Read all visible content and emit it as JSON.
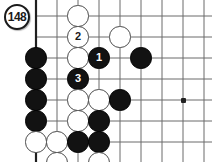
{
  "diagram": {
    "badge_label": "148",
    "board": {
      "origin_x": 36,
      "origin_y": 16,
      "spacing": 21,
      "left_edge_thick": true,
      "bottom_edge_thick": true,
      "columns": 9,
      "rows": 7,
      "line_color": "#6a6a6a",
      "edge_color": "#1f1f1f",
      "background": "#ffffff"
    },
    "star_points": [
      {
        "col": 7,
        "row": 4
      }
    ],
    "stones": [
      {
        "color": "white",
        "col": 2,
        "row": 0,
        "label": ""
      },
      {
        "color": "white",
        "col": 2,
        "row": 1,
        "label": "2"
      },
      {
        "color": "white",
        "col": 4,
        "row": 1,
        "label": ""
      },
      {
        "color": "black",
        "col": 0,
        "row": 2,
        "label": ""
      },
      {
        "color": "white",
        "col": 2,
        "row": 2,
        "label": ""
      },
      {
        "color": "black",
        "col": 3,
        "row": 2,
        "label": "1"
      },
      {
        "color": "black",
        "col": 5,
        "row": 2,
        "label": ""
      },
      {
        "color": "black",
        "col": 0,
        "row": 3,
        "label": ""
      },
      {
        "color": "black",
        "col": 2,
        "row": 3,
        "label": "3"
      },
      {
        "color": "black",
        "col": 0,
        "row": 4,
        "label": ""
      },
      {
        "color": "white",
        "col": 2,
        "row": 4,
        "label": ""
      },
      {
        "color": "white",
        "col": 3,
        "row": 4,
        "label": ""
      },
      {
        "color": "black",
        "col": 4,
        "row": 4,
        "label": ""
      },
      {
        "color": "black",
        "col": 0,
        "row": 5,
        "label": ""
      },
      {
        "color": "white",
        "col": 2,
        "row": 5,
        "label": ""
      },
      {
        "color": "black",
        "col": 3,
        "row": 5,
        "label": ""
      },
      {
        "color": "white",
        "col": 0,
        "row": 6,
        "label": ""
      },
      {
        "color": "white",
        "col": 1,
        "row": 6,
        "label": ""
      },
      {
        "color": "black",
        "col": 2,
        "row": 6,
        "label": ""
      },
      {
        "color": "black",
        "col": 3,
        "row": 6,
        "label": ""
      },
      {
        "color": "white",
        "col": 1,
        "row": 7,
        "label": ""
      },
      {
        "color": "white",
        "col": 3,
        "row": 7,
        "label": ""
      },
      {
        "color": "white",
        "col": 2,
        "row": 8,
        "label": ""
      }
    ],
    "badge": {
      "x": 4,
      "y": 4
    }
  }
}
